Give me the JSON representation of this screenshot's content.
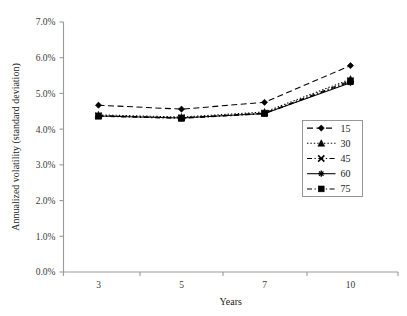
{
  "chart_data": {
    "type": "line",
    "title": "",
    "xlabel": "Years",
    "ylabel": "Annualized volatility (standard deviation)",
    "categories": [
      "3",
      "5",
      "7",
      "10"
    ],
    "x_tick_labels": [
      "3",
      "5",
      "7",
      "10"
    ],
    "y_tick_labels": [
      "0.0%",
      "1.0%",
      "2.0%",
      "3.0%",
      "4.0%",
      "5.0%",
      "6.0%",
      "7.0%"
    ],
    "y_tick_values": [
      0.0,
      1.0,
      2.0,
      3.0,
      4.0,
      5.0,
      6.0,
      7.0
    ],
    "ylim": [
      0.0,
      7.0
    ],
    "grid": false,
    "legend_position": "center-right",
    "units": "percent",
    "series": [
      {
        "name": "15",
        "marker": "diamond",
        "dash": "dashed",
        "values": [
          4.67,
          4.56,
          4.75,
          5.78
        ]
      },
      {
        "name": "30",
        "marker": "triangle",
        "dash": "dotted",
        "values": [
          4.4,
          4.34,
          4.48,
          5.4
        ]
      },
      {
        "name": "45",
        "marker": "x-cross",
        "dash": "dash-dot",
        "values": [
          4.38,
          4.32,
          4.45,
          5.36
        ]
      },
      {
        "name": "60",
        "marker": "asterisk",
        "dash": "solid",
        "values": [
          4.37,
          4.31,
          4.44,
          5.3
        ]
      },
      {
        "name": "75",
        "marker": "square",
        "dash": "dash-dot",
        "values": [
          4.36,
          4.3,
          4.43,
          5.33
        ]
      }
    ],
    "legend_entries": [
      "15",
      "30",
      "45",
      "60",
      "75"
    ],
    "colors": {
      "series": "#000000",
      "axis": "#9a9a9a",
      "tick_text": "#3a3a3a",
      "background": "#ffffff"
    }
  }
}
